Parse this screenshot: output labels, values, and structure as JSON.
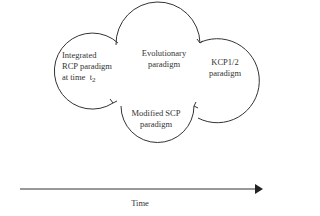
{
  "diagram": {
    "nodes": [
      {
        "id": "integrated",
        "lines": [
          "Integrated",
          "RCP paradigm",
          "at time"
        ],
        "subscript_label": "t",
        "subscript": "2"
      },
      {
        "id": "evolutionary",
        "lines": [
          "Evolutionary",
          "paradigm"
        ]
      },
      {
        "id": "kcp",
        "lines": [
          "KCP1/2",
          "paradigm"
        ]
      },
      {
        "id": "modified_scp",
        "lines": [
          "Modified SCP",
          "paradigm"
        ]
      }
    ],
    "axis": {
      "label": "Time",
      "direction": "right"
    },
    "colors": {
      "stroke": "#333333",
      "text": "#333333",
      "background": "#ffffff"
    }
  }
}
